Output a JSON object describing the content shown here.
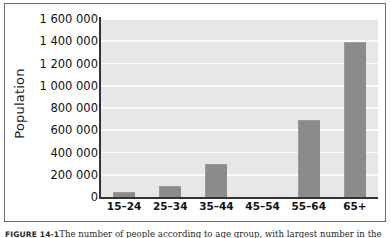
{
  "figure": {
    "caption_number": "FIGURE 14-1",
    "caption_text": "The number of people according to age group, with largest number in the"
  },
  "chart_data": {
    "type": "bar",
    "title": "",
    "xlabel": "",
    "ylabel": "Population",
    "categories": [
      "15–24",
      "25–34",
      "35–44",
      "45–54",
      "55–64",
      "65+"
    ],
    "values": [
      45000,
      95000,
      300000,
      0,
      690000,
      1395000
    ],
    "ylim": [
      0,
      1600000
    ],
    "ytick_values": [
      0,
      200000,
      400000,
      600000,
      800000,
      1000000,
      1200000,
      1400000,
      1600000
    ],
    "ytick_labels": [
      "0",
      "200 000",
      "400 000",
      "600 000",
      "800 000",
      "1 000 000",
      "1 200 000",
      "1 400 000",
      "1 600 000"
    ],
    "grid": true,
    "grid_axis": "y",
    "legend": false,
    "bar_color": "#8b8b8b",
    "plot_background": "#e7e7e7",
    "gridline_color": "#fbfbfb",
    "axis_color": "#333333"
  }
}
